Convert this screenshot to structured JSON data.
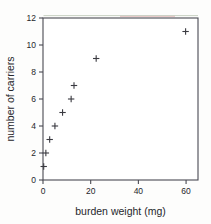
{
  "chart_data": {
    "type": "scatter",
    "title": "",
    "subtitle": "",
    "xlabel": "burden weight (mg)",
    "ylabel": "number of carriers",
    "xlim": [
      0,
      65
    ],
    "ylim": [
      0,
      12
    ],
    "xticks": [
      0,
      20,
      40,
      60
    ],
    "xtick_labels": [
      "0",
      "20",
      "40",
      "60"
    ],
    "yticks": [
      0,
      2,
      4,
      6,
      8,
      10,
      12
    ],
    "ytick_labels": [
      "0",
      "2",
      "4",
      "6",
      "8",
      "10",
      "12"
    ],
    "grid": false,
    "legend": null,
    "legend_position": "none",
    "marker": "+",
    "marker_color": "#3a3a40",
    "frame_color": "#4a4a52",
    "series": [
      {
        "name": "carriers vs burden weight",
        "x": [
          0.3,
          1.2,
          2.8,
          5.0,
          8.2,
          11.8,
          13.0,
          22.3,
          59.8
        ],
        "y": [
          1,
          2,
          3,
          4,
          5,
          6,
          7,
          9,
          11
        ]
      }
    ],
    "annotations": []
  },
  "axes": {
    "x_axis_label": "burden weight (mg)",
    "y_axis_label": "number of carriers"
  }
}
